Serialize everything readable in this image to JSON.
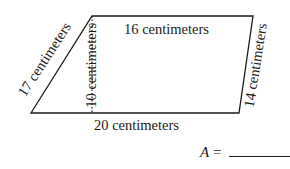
{
  "figure": {
    "shape": "quadrilateral",
    "labels": {
      "top": "16 centimeters",
      "bottom": "20 centimeters",
      "left": "17 centimeters",
      "right": "14 centimeters",
      "height": "10 centimeters"
    }
  },
  "answer": {
    "variable": "A",
    "equals": "="
  }
}
